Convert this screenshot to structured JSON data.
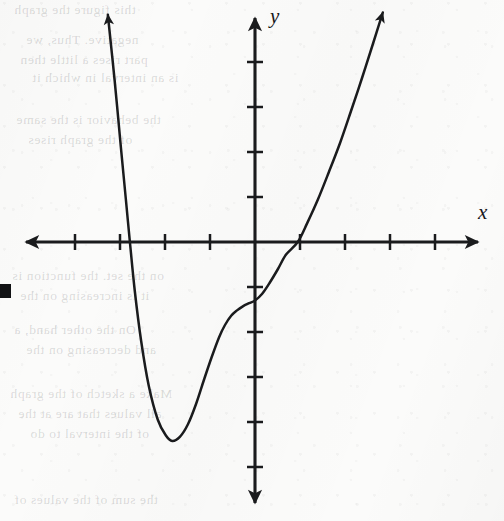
{
  "figure": {
    "kind": "cartesian-graph",
    "axis_labels": {
      "x": "x",
      "y": "y"
    },
    "ink_color": "#1a1b1d",
    "paper_color": "#fbfbfa",
    "edge_artifact": {
      "name": "scan-edge-mark",
      "x": 0,
      "y": 284,
      "width": 11,
      "height": 14
    }
  },
  "chart_data": {
    "type": "line",
    "title": "",
    "xlabel": "x",
    "ylabel": "y",
    "grid": false,
    "legend": null,
    "axes": {
      "origin_px": [
        255,
        242
      ],
      "x_unit_px": 45,
      "y_unit_px": 45,
      "xlim": [
        -5.2,
        5.2
      ],
      "ylim": [
        -5.5,
        5.2
      ],
      "x_ticks": [
        -4,
        -3,
        -2,
        -1,
        1,
        2,
        3,
        4
      ],
      "y_ticks": [
        -5,
        -4,
        -3,
        -2,
        -1,
        1,
        2,
        3,
        4
      ],
      "tick_labels_shown": false,
      "arrowheads": [
        "x-negative",
        "x-positive",
        "y-negative",
        "y-positive"
      ]
    },
    "curve": {
      "name": "polynomial-curve",
      "description": "Quartic-like curve: falls steeply from upper left, crosses the x-axis near x = -2.8, reaches a minimum near (-1.8, -4.4), rises to a flat shoulder (inflection) near (-0.5, -1.6), crosses the y-axis near y = -1.3, then crosses the x-axis at about x = 1 and rises steeply to the upper right.",
      "x_intercepts": [
        -2.8,
        0.95
      ],
      "y_intercept": -1.3,
      "local_minimum": [
        -1.84,
        -4.4
      ],
      "inflection_shoulder": [
        -0.5,
        -1.6
      ],
      "end_behavior": {
        "left": "+infinity",
        "right": "+infinity"
      },
      "points": [
        [
          -3.27,
          5.05
        ],
        [
          -3.12,
          3.6
        ],
        [
          -2.98,
          2.1
        ],
        [
          -2.87,
          0.95
        ],
        [
          -2.78,
          0.0
        ],
        [
          -2.67,
          -1.1
        ],
        [
          -2.53,
          -2.2
        ],
        [
          -2.36,
          -3.2
        ],
        [
          -2.16,
          -3.95
        ],
        [
          -1.98,
          -4.3
        ],
        [
          -1.84,
          -4.42
        ],
        [
          -1.67,
          -4.33
        ],
        [
          -1.49,
          -4.05
        ],
        [
          -1.31,
          -3.6
        ],
        [
          -1.13,
          -3.05
        ],
        [
          -0.96,
          -2.55
        ],
        [
          -0.8,
          -2.12
        ],
        [
          -0.67,
          -1.85
        ],
        [
          -0.53,
          -1.64
        ],
        [
          -0.4,
          -1.52
        ],
        [
          -0.27,
          -1.43
        ],
        [
          -0.13,
          -1.36
        ],
        [
          0.0,
          -1.3
        ],
        [
          0.16,
          -1.15
        ],
        [
          0.33,
          -0.9
        ],
        [
          0.51,
          -0.6
        ],
        [
          0.69,
          -0.28
        ],
        [
          0.95,
          0.0
        ],
        [
          1.16,
          0.42
        ],
        [
          1.4,
          0.95
        ],
        [
          1.64,
          1.55
        ],
        [
          1.89,
          2.2
        ],
        [
          2.13,
          2.9
        ],
        [
          2.38,
          3.65
        ],
        [
          2.62,
          4.4
        ],
        [
          2.84,
          5.1
        ]
      ]
    }
  },
  "showthrough_text": [
    {
      "text": "this figure the graph",
      "x": 14,
      "y": 2
    },
    {
      "text": "negative. Thus, we",
      "x": 26,
      "y": 32
    },
    {
      "text": "part rises a little then",
      "x": 20,
      "y": 52
    },
    {
      "text": "is an interval in which it",
      "x": 32,
      "y": 70
    },
    {
      "text": "the behavior is the same",
      "x": 16,
      "y": 112
    },
    {
      "text": "of the graph rises",
      "x": 28,
      "y": 132
    },
    {
      "text": "on the set. the function is",
      "x": 12,
      "y": 268
    },
    {
      "text": "it is increasing on the",
      "x": 20,
      "y": 288
    },
    {
      "text": "On the other hand, a",
      "x": 14,
      "y": 322
    },
    {
      "text": "and decreasing on the",
      "x": 26,
      "y": 342
    },
    {
      "text": "Make a sketch of the graph",
      "x": 10,
      "y": 386
    },
    {
      "text": "all values that are at the",
      "x": 18,
      "y": 406
    },
    {
      "text": "of the interval to do",
      "x": 30,
      "y": 426
    },
    {
      "text": "the sum of the values of",
      "x": 14,
      "y": 492
    }
  ]
}
